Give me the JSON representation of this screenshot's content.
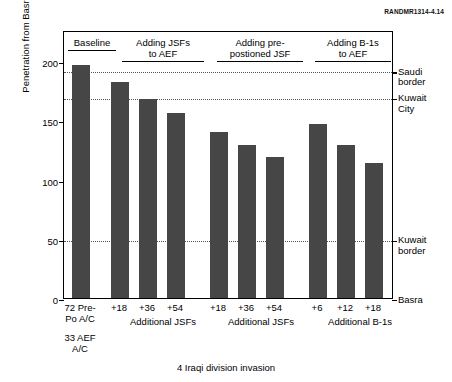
{
  "source_id": "RANDMR1314-4.14",
  "caption": "4 Iraqi division invasion",
  "chart_data": {
    "type": "bar",
    "title": "",
    "xlabel": "4 Iraqi division invasion",
    "ylabel": "Penetration from Basra (km)",
    "ylim": [
      0,
      200
    ],
    "yticks": [
      0,
      50,
      100,
      150,
      200
    ],
    "grid": false,
    "legend": "none",
    "bar_color": "#464646",
    "categories": [
      "72 Pre-Po A/C 33 AEF A/C",
      "+18",
      "+36",
      "+54",
      "+18",
      "+36",
      "+54",
      "+6",
      "+12",
      "+18"
    ],
    "values": [
      197,
      182,
      168,
      156,
      140,
      129,
      119,
      147,
      129,
      114
    ],
    "groups": [
      {
        "header": "Baseline",
        "header_line2": "",
        "subtitle": "",
        "ticks": [
          "72 Pre-\nPo A/C",
          "33 AEF\nA/C"
        ],
        "bars": [
          {
            "label": "72 Pre-Po A/C 33 AEF A/C",
            "value": 197
          }
        ]
      },
      {
        "header": "Adding JSFs",
        "header_line2": "to AEF",
        "subtitle": "Additional JSFs",
        "bars": [
          {
            "label": "+18",
            "value": 182
          },
          {
            "label": "+36",
            "value": 168
          },
          {
            "label": "+54",
            "value": 156
          }
        ]
      },
      {
        "header": "Adding pre-",
        "header_line2": "postioned JSF",
        "subtitle": "Additional JSFs",
        "bars": [
          {
            "label": "+18",
            "value": 140
          },
          {
            "label": "+36",
            "value": 129
          },
          {
            "label": "+54",
            "value": 119
          }
        ]
      },
      {
        "header": "Adding B-1s",
        "header_line2": "to AEF",
        "subtitle": "Additional B-1s",
        "bars": [
          {
            "label": "+6",
            "value": 147
          },
          {
            "label": "+12",
            "value": 129
          },
          {
            "label": "+18",
            "value": 114
          }
        ]
      }
    ],
    "reference_lines": [
      {
        "label_line1": "Saudi",
        "label_line2": "border",
        "value": 192
      },
      {
        "label_line1": "Kuwait",
        "label_line2": "City",
        "value": 170
      },
      {
        "label_line1": "Kuwait",
        "label_line2": "border",
        "value": 50
      },
      {
        "label_line1": "Basra",
        "label_line2": "",
        "value": 0
      }
    ]
  },
  "xticks_group1": {
    "line1": "72 Pre-",
    "line2": "Po A/C",
    "line3": "33 AEF",
    "line4": "A/C"
  }
}
